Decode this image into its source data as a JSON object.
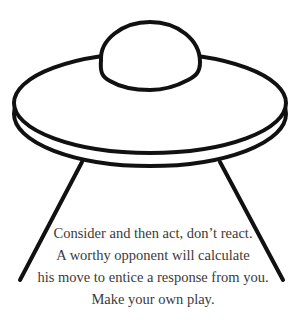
{
  "illustration": {
    "subject": "ufo-icon",
    "stroke_color": "#111111",
    "background": "#ffffff"
  },
  "caption": {
    "lines": [
      "Consider and then act, don’t react.",
      "A worthy opponent will calculate",
      "his move to entice a response from you.",
      "Make your own play."
    ],
    "color": "#3a3a3a"
  }
}
